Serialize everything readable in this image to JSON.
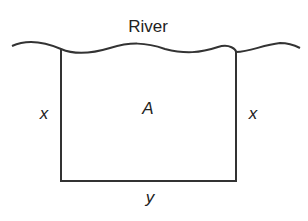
{
  "diagram": {
    "title": "River",
    "labels": {
      "left_side": "x",
      "right_side": "x",
      "area": "A",
      "bottom_side": "y"
    },
    "colors": {
      "line": "#333333",
      "text": "#222222",
      "background": "#ffffff"
    }
  }
}
